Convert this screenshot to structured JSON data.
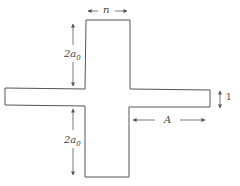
{
  "diagram": {
    "type": "cross-shaped planar structure",
    "labels": {
      "top_width": "n",
      "upper_arm_length": "2a",
      "upper_arm_sub": "0",
      "lower_arm_length": "2a",
      "lower_arm_sub": "0",
      "right_arm_length": "A",
      "arm_thickness": "1"
    },
    "colors": {
      "stroke": "#555555",
      "background": "#ffffff"
    }
  }
}
